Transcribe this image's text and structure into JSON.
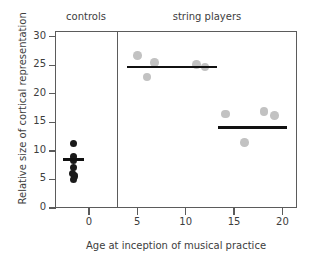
{
  "chart_data": {
    "type": "scatter",
    "title": "",
    "xlabel": "Age at inception of musical practice",
    "ylabel": "Relative size of cortical representation",
    "xlim": [
      -3.5,
      21.5
    ],
    "ylim": [
      0,
      31
    ],
    "xticks": [
      0,
      5,
      10,
      15,
      20
    ],
    "xtick_labels": [
      "0",
      "5",
      "10",
      "15",
      "20"
    ],
    "yticks": [
      0,
      5,
      10,
      15,
      20,
      25,
      30
    ],
    "ytick_labels": [
      "0",
      "5",
      "10",
      "15",
      "20",
      "25",
      "30"
    ],
    "grid": false,
    "legend": "none",
    "group_labels": [
      "controls",
      "string players"
    ],
    "series": [
      {
        "name": "controls",
        "color": "#1a1a1a",
        "points": [
          {
            "x": -1.6,
            "y": 11.3
          },
          {
            "x": -1.6,
            "y": 9.0
          },
          {
            "x": -1.6,
            "y": 8.4
          },
          {
            "x": -1.6,
            "y": 7.1
          },
          {
            "x": -1.7,
            "y": 6.0
          },
          {
            "x": -1.5,
            "y": 5.6
          },
          {
            "x": -1.6,
            "y": 5.0
          }
        ],
        "mean": 8.5,
        "mean_line_x": [
          -2.7,
          -0.5
        ]
      },
      {
        "name": "string players early onset",
        "color": "#c2c2c2",
        "points": [
          {
            "x": 5.0,
            "y": 26.7
          },
          {
            "x": 6.0,
            "y": 22.9
          },
          {
            "x": 6.8,
            "y": 25.5
          },
          {
            "x": 11.1,
            "y": 25.1
          },
          {
            "x": 12.0,
            "y": 24.7
          }
        ],
        "mean": 24.7,
        "mean_line_x": [
          3.9,
          13.2
        ]
      },
      {
        "name": "string players late onset",
        "color": "#c2c2c2",
        "points": [
          {
            "x": 14.1,
            "y": 16.5
          },
          {
            "x": 16.1,
            "y": 11.5
          },
          {
            "x": 18.1,
            "y": 16.9
          },
          {
            "x": 19.2,
            "y": 16.2
          }
        ],
        "mean": 14.1,
        "mean_line_x": [
          13.3,
          20.5
        ]
      }
    ]
  },
  "figure": {
    "caption_controls": "controls",
    "caption_strings": "string players",
    "x_axis_title": "Age at inception of musical practice",
    "y_axis_title": "Relative size of cortical representation"
  }
}
